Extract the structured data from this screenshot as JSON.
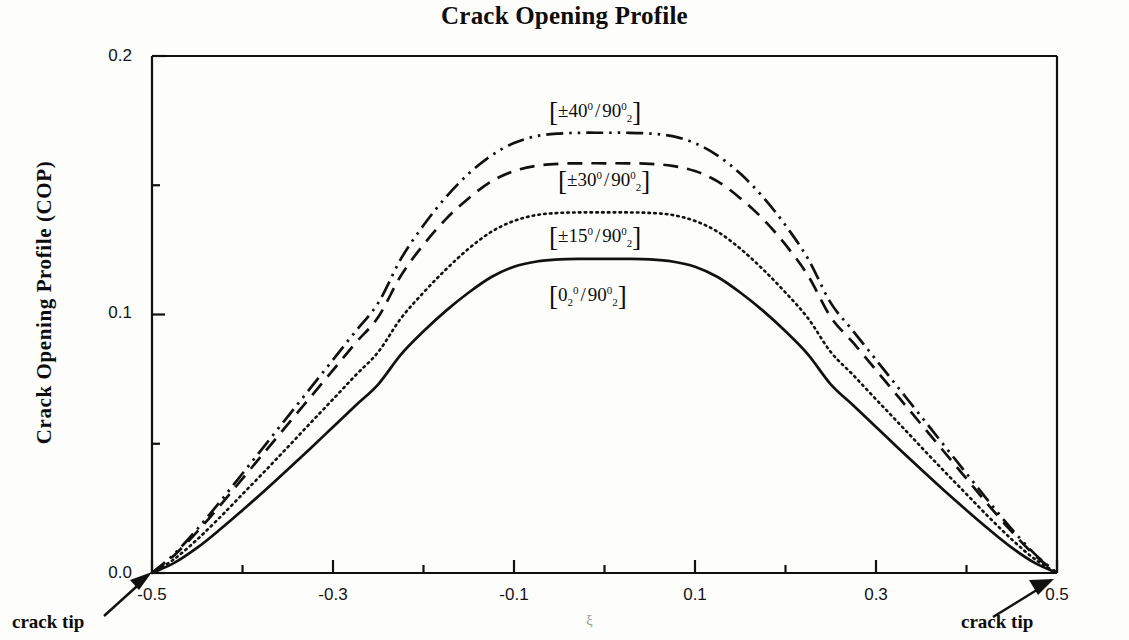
{
  "title": "Crack Opening Profile",
  "axes": {
    "y_title": "Crack Opening Profile (COP)",
    "x_title": "ξ",
    "y_ticks": [
      "0.0",
      "0.1",
      "0.2"
    ],
    "x_ticks": [
      "-0.5",
      "-0.3",
      "-0.1",
      "0.1",
      "0.3",
      "0.5"
    ]
  },
  "annotations": {
    "left_crack_tip": "crack tip",
    "right_crack_tip": "crack tip"
  },
  "legend": [
    {
      "id": "l40",
      "pm": "±40",
      "deg": "0",
      "second": "90",
      "sub": "2",
      "sup": "0",
      "first_sub": ""
    },
    {
      "id": "l30",
      "pm": "±30",
      "deg": "0",
      "second": "90",
      "sub": "2",
      "sup": "0",
      "first_sub": ""
    },
    {
      "id": "l15",
      "pm": "±15",
      "deg": "0",
      "second": "90",
      "sub": "2",
      "sup": "0",
      "first_sub": ""
    },
    {
      "id": "l00",
      "pm": "0",
      "deg": "0",
      "second": "90",
      "sub": "2",
      "sup": "0",
      "first_sub": "2"
    }
  ],
  "chart_data": {
    "type": "line",
    "title": "Crack Opening Profile",
    "xlabel": "ξ",
    "ylabel": "Crack Opening Profile (COP)",
    "xlim": [
      -0.5,
      0.5
    ],
    "ylim": [
      0.0,
      0.2
    ],
    "grid": false,
    "legend_position": "inline-labels",
    "x": [
      -0.5,
      -0.475,
      -0.45,
      -0.425,
      -0.4,
      -0.375,
      -0.35,
      -0.325,
      -0.3,
      -0.275,
      -0.25,
      -0.225,
      -0.2,
      -0.175,
      -0.15,
      -0.125,
      -0.1,
      -0.075,
      -0.05,
      -0.025,
      0.0,
      0.025,
      0.05,
      0.075,
      0.1,
      0.125,
      0.15,
      0.175,
      0.2,
      0.225,
      0.25,
      0.275,
      0.3,
      0.325,
      0.35,
      0.375,
      0.4,
      0.425,
      0.45,
      0.475,
      0.5
    ],
    "series": [
      {
        "name": "[±40° / 90°₂]",
        "style": "dash-dot-dot",
        "peak": 0.17,
        "values": [
          0.0,
          0.0075,
          0.017,
          0.0275,
          0.0385,
          0.0495,
          0.0605,
          0.0715,
          0.0825,
          0.0935,
          0.1045,
          0.1215,
          0.1345,
          0.1455,
          0.1545,
          0.1615,
          0.1663,
          0.169,
          0.17,
          0.1703,
          0.1703,
          0.1703,
          0.17,
          0.169,
          0.1663,
          0.1615,
          0.1545,
          0.1455,
          0.1345,
          0.1215,
          0.1045,
          0.0935,
          0.0825,
          0.0715,
          0.0605,
          0.0495,
          0.0385,
          0.0275,
          0.017,
          0.0075,
          0.0
        ]
      },
      {
        "name": "[±30° / 90°₂]",
        "style": "dashed",
        "peak": 0.158,
        "values": [
          0.0,
          0.007,
          0.016,
          0.026,
          0.0365,
          0.047,
          0.0575,
          0.068,
          0.0785,
          0.089,
          0.099,
          0.115,
          0.127,
          0.137,
          0.145,
          0.1515,
          0.1555,
          0.1575,
          0.1583,
          0.1585,
          0.1585,
          0.1585,
          0.1583,
          0.1575,
          0.1555,
          0.1515,
          0.145,
          0.137,
          0.127,
          0.115,
          0.099,
          0.089,
          0.0785,
          0.068,
          0.0575,
          0.047,
          0.0365,
          0.026,
          0.016,
          0.007,
          0.0
        ]
      },
      {
        "name": "[±15° / 90°₂]",
        "style": "dotted",
        "peak": 0.139,
        "values": [
          0.0,
          0.0055,
          0.013,
          0.0215,
          0.0305,
          0.0395,
          0.0487,
          0.058,
          0.0672,
          0.0765,
          0.0855,
          0.0985,
          0.1085,
          0.1175,
          0.1255,
          0.132,
          0.1362,
          0.1385,
          0.1393,
          0.1395,
          0.1395,
          0.1395,
          0.1393,
          0.1385,
          0.1362,
          0.132,
          0.1255,
          0.1175,
          0.1085,
          0.0985,
          0.0855,
          0.0765,
          0.0672,
          0.058,
          0.0487,
          0.0395,
          0.0305,
          0.0215,
          0.013,
          0.0055,
          0.0
        ]
      },
      {
        "name": "[0°₂ / 90°₂]",
        "style": "solid",
        "peak": 0.121,
        "values": [
          0.0,
          0.004,
          0.0098,
          0.0168,
          0.0243,
          0.032,
          0.04,
          0.0482,
          0.0565,
          0.0648,
          0.073,
          0.0845,
          0.0935,
          0.1015,
          0.1085,
          0.1145,
          0.1185,
          0.1205,
          0.1213,
          0.1215,
          0.1215,
          0.1215,
          0.1213,
          0.1205,
          0.1185,
          0.1145,
          0.1085,
          0.1015,
          0.0935,
          0.0845,
          0.073,
          0.0648,
          0.0565,
          0.0482,
          0.04,
          0.032,
          0.0243,
          0.0168,
          0.0098,
          0.004,
          0.0
        ]
      }
    ]
  }
}
